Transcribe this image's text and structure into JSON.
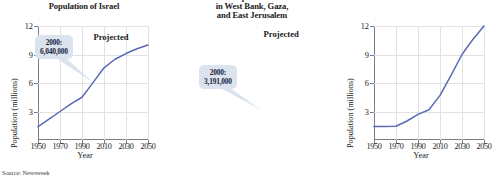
{
  "source_note": "Source: Newsweek",
  "charts": [
    {
      "id": "israel",
      "title_lines": [
        "Population of Israel"
      ],
      "annotation": "Projected",
      "callout": {
        "year_label": "2000:",
        "value_label": "6,040,000"
      },
      "chart_data": {
        "type": "line",
        "title": "Population of Israel",
        "xlabel": "Year",
        "ylabel": "Population (millions)",
        "xlim": [
          1950,
          2050
        ],
        "ylim": [
          0,
          12
        ],
        "xticks": [
          1950,
          1970,
          1990,
          2010,
          2030,
          2050
        ],
        "yticks": [
          3,
          6,
          9,
          12
        ],
        "grid": true,
        "legend": "none",
        "annotations": [
          {
            "text": "Projected",
            "x": 2024,
            "y": 10.8
          },
          {
            "text": "2000: 6,040,000",
            "x": 2000,
            "y": 6.04
          }
        ],
        "series": [
          {
            "name": "Population of Israel",
            "color": "#5b6ab5",
            "x": [
              1950,
              1960,
              1970,
              1980,
              1990,
              2000,
              2010,
              2020,
              2030,
              2040,
              2050
            ],
            "values": [
              1.4,
              2.2,
              3.0,
              3.8,
              4.5,
              6.04,
              7.6,
              8.5,
              9.1,
              9.6,
              10.0
            ]
          }
        ]
      }
    },
    {
      "id": "west-bank-gaza",
      "title_lines": [
        "Population",
        "in West Bank, Gaza,",
        "and East Jerusalem"
      ],
      "annotation": "Projected",
      "callout": {
        "year_label": "2000:",
        "value_label": "3,191,000"
      },
      "chart_data": {
        "type": "line",
        "title": "Population in West Bank, Gaza, and East Jerusalem",
        "xlabel": "Year",
        "ylabel": "Population (millions)",
        "xlim": [
          1950,
          2050
        ],
        "ylim": [
          0,
          12
        ],
        "xticks": [
          1950,
          1970,
          1990,
          2010,
          2030,
          2050
        ],
        "yticks": [
          3,
          6,
          9,
          12
        ],
        "grid": true,
        "legend": "none",
        "annotations": [
          {
            "text": "Projected",
            "x": 2026,
            "y": 11.2
          },
          {
            "text": "2000: 3,191,000",
            "x": 2000,
            "y": 3.191
          }
        ],
        "series": [
          {
            "name": "Population in West Bank, Gaza, and East Jerusalem",
            "color": "#5b6ab5",
            "x": [
              1950,
              1960,
              1970,
              1980,
              1990,
              2000,
              2010,
              2020,
              2030,
              2040,
              2050
            ],
            "values": [
              1.42,
              1.42,
              1.45,
              2.0,
              2.7,
              3.191,
              4.7,
              6.8,
              9.0,
              10.6,
              12.0
            ]
          }
        ]
      }
    }
  ]
}
